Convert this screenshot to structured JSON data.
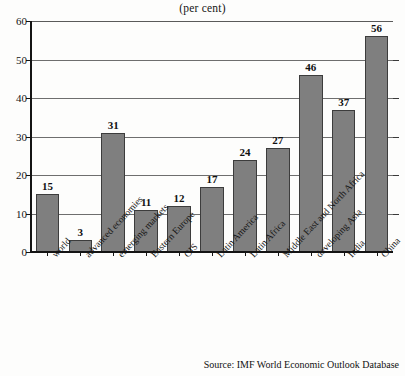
{
  "chart_data": {
    "type": "bar",
    "title": "(per cent)",
    "xlabel": "",
    "ylabel": "",
    "ylim": [
      0,
      60
    ],
    "yticks": [
      0,
      10,
      20,
      30,
      40,
      50,
      60
    ],
    "grid": true,
    "legend": null,
    "categories": [
      "world",
      "advanced economies",
      "emerging markets",
      "Eastern Europe",
      "CIS",
      "Latin America",
      "Latin Africa",
      "Middle East and North Africa",
      "developing Asia",
      "India",
      "China"
    ],
    "values": [
      15,
      3,
      31,
      11,
      12,
      17,
      24,
      27,
      46,
      37,
      56
    ],
    "value_labels": [
      "15",
      "3",
      "31",
      "11",
      "12",
      "17",
      "24",
      "27",
      "46",
      "37",
      "56"
    ],
    "source": "Source: IMF World Economic Outlook Database",
    "colors": {
      "bar_fill": "#7f7f7f",
      "bar_edge": "#3c3c3c",
      "axis": "#141414",
      "grid": "#6e6e6e",
      "background": "#fdfdfc",
      "text": "#141414"
    }
  }
}
